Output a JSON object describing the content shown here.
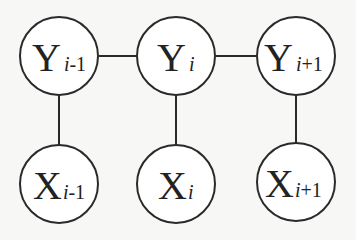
{
  "diagram": {
    "type": "linear-chain CRF graphical model",
    "colors": {
      "stroke": "#2a2a2a",
      "background": "#f7f7f5",
      "node_fill": "#ffffff"
    },
    "nodes": [
      {
        "id": "y_prev",
        "symbol": "Y",
        "index_var": "i",
        "offset": "-1",
        "row": "top"
      },
      {
        "id": "y_cur",
        "symbol": "Y",
        "index_var": "i",
        "offset": "",
        "row": "top"
      },
      {
        "id": "y_next",
        "symbol": "Y",
        "index_var": "i",
        "offset": "+1",
        "row": "top"
      },
      {
        "id": "x_prev",
        "symbol": "X",
        "index_var": "i",
        "offset": "-1",
        "row": "bottom"
      },
      {
        "id": "x_cur",
        "symbol": "X",
        "index_var": "i",
        "offset": "",
        "row": "bottom"
      },
      {
        "id": "x_next",
        "symbol": "X",
        "index_var": "i",
        "offset": "+1",
        "row": "bottom"
      }
    ],
    "edges": [
      [
        "y_prev",
        "y_cur"
      ],
      [
        "y_cur",
        "y_next"
      ],
      [
        "y_prev",
        "x_prev"
      ],
      [
        "y_cur",
        "x_cur"
      ],
      [
        "y_next",
        "x_next"
      ]
    ]
  }
}
